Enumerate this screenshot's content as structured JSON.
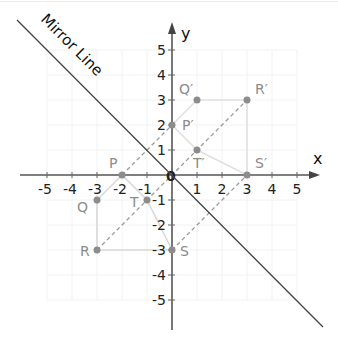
{
  "diagram": {
    "mirror_label": "Mirror Line",
    "x_axis_label": "x",
    "y_axis_label": "y",
    "origin_label": "0",
    "x_ticks": [
      "-5",
      "-4",
      "-3",
      "-2",
      "-1",
      "1",
      "2",
      "3",
      "4",
      "5"
    ],
    "y_ticks": [
      "5",
      "4",
      "3",
      "2",
      "1",
      "-1",
      "-2",
      "-3",
      "-4",
      "-5"
    ],
    "colors": {
      "axis": "#555555",
      "mirror_line": "#444444",
      "point": "#8c8c8c",
      "shape_edge": "#d9d9d9",
      "dashed": "#9a9a9a",
      "grid": "#f3f3f3"
    },
    "original_points": [
      {
        "label": "P",
        "x": -2,
        "y": 0
      },
      {
        "label": "Q",
        "x": -3,
        "y": -1
      },
      {
        "label": "R",
        "x": -3,
        "y": -3
      },
      {
        "label": "S",
        "x": 0,
        "y": -3
      },
      {
        "label": "T",
        "x": -1,
        "y": -1
      }
    ],
    "image_points": [
      {
        "label": "P′",
        "x": 0,
        "y": 2
      },
      {
        "label": "Q′",
        "x": 1,
        "y": 3
      },
      {
        "label": "R′",
        "x": 3,
        "y": 3
      },
      {
        "label": "S′",
        "x": 3,
        "y": 0
      },
      {
        "label": "T′",
        "x": 1,
        "y": 1
      }
    ],
    "mirror_line_equation": "y = -x"
  },
  "labels": {
    "P": "P",
    "Q": "Q",
    "R": "R",
    "S": "S",
    "T": "T",
    "P2": "P′",
    "Q2": "Q′",
    "R2": "R′",
    "S2": "S′",
    "T2": "T′"
  }
}
